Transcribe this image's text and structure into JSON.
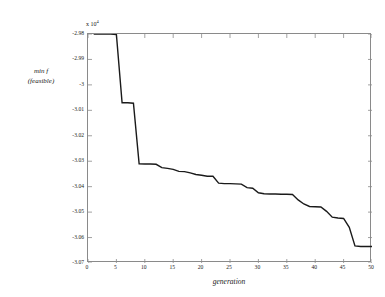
{
  "chart_data": {
    "type": "line",
    "title": "",
    "xlabel": "generation",
    "ylabel_lines": [
      "min f",
      "(feasible)"
    ],
    "y_multiplier": "x 10",
    "y_multiplier_exp": "4",
    "xlim": [
      0,
      50
    ],
    "ylim": [
      -3.07,
      -2.98
    ],
    "grid": false,
    "legend": null,
    "xticks": [
      0,
      5,
      10,
      15,
      20,
      25,
      30,
      35,
      40,
      45,
      50
    ],
    "xtick_labels": [
      "0",
      "5",
      "10",
      "15",
      "20",
      "25",
      "30",
      "35",
      "40",
      "45",
      "50"
    ],
    "yticks": [
      -2.98,
      -2.99,
      -3,
      -3.01,
      -3.02,
      -3.03,
      -3.04,
      -3.05,
      -3.06,
      -3.07
    ],
    "ytick_labels": [
      "-2.98",
      "-2.99",
      "-3",
      "-3.01",
      "-3.02",
      "-3.03",
      "-3.04",
      "-3.05",
      "-3.06",
      "-3.07"
    ],
    "line_color": "#1a1a1a",
    "line_width": 1.4,
    "series": [
      {
        "name": "min f (feasible)",
        "x": [
          1,
          2,
          3,
          4,
          5,
          6,
          7,
          8,
          9,
          10,
          11,
          12,
          13,
          14,
          15,
          16,
          17,
          18,
          19,
          20,
          21,
          22,
          23,
          24,
          25,
          26,
          27,
          28,
          29,
          30,
          31,
          32,
          33,
          34,
          35,
          36,
          37,
          38,
          39,
          40,
          41,
          42,
          43,
          44,
          45,
          46,
          47,
          48,
          49,
          50
        ],
        "values": [
          -2.98,
          -2.98,
          -2.98,
          -2.98,
          -2.9802,
          -3.007,
          -3.007,
          -3.0072,
          -3.031,
          -3.0311,
          -3.0311,
          -3.0312,
          -3.0325,
          -3.0328,
          -3.0332,
          -3.034,
          -3.0341,
          -3.0346,
          -3.0352,
          -3.0355,
          -3.0359,
          -3.0359,
          -3.0386,
          -3.0388,
          -3.0388,
          -3.0389,
          -3.039,
          -3.0404,
          -3.0406,
          -3.0424,
          -3.0428,
          -3.0429,
          -3.0429,
          -3.043,
          -3.043,
          -3.0431,
          -3.0452,
          -3.0468,
          -3.0478,
          -3.0479,
          -3.048,
          -3.0497,
          -3.052,
          -3.0523,
          -3.0525,
          -3.056,
          -3.0633,
          -3.0635,
          -3.0635,
          -3.0635
        ]
      }
    ]
  }
}
